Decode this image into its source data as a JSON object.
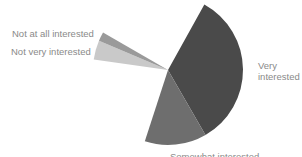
{
  "chart_data": {
    "type": "pie",
    "title": "",
    "center": [
      168,
      70
    ],
    "radius": 75,
    "slices": [
      {
        "label": "Very interested",
        "start_deg": -61,
        "end_deg": 60,
        "share_pct": 33.6,
        "color": "#4a4a4a"
      },
      {
        "label": "Somewhat interested",
        "start_deg": 60,
        "end_deg": 108,
        "share_pct": 13.3,
        "color": "#6e6e6e"
      },
      {
        "label": "Not very interested",
        "start_deg": 188,
        "end_deg": 203,
        "share_pct": 4.2,
        "color": "#c9c9c9"
      },
      {
        "label": "Not at all interested",
        "start_deg": 203,
        "end_deg": 210,
        "share_pct": 1.9,
        "color": "#9a9a9a"
      }
    ],
    "legend": "inline labels"
  },
  "labels": {
    "very": "Very interested",
    "somewhat": "Somewhat interested",
    "not_very": "Not very interested",
    "not_at_all": "Not at all interested"
  }
}
